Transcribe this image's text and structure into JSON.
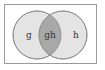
{
  "diagram": {
    "type": "venn",
    "sets": [
      {
        "name": "g",
        "label": "g"
      },
      {
        "name": "h",
        "label": "h"
      }
    ],
    "regions": {
      "left_only": "g",
      "intersection": "gh",
      "right_only": "h"
    },
    "colors": {
      "frame_stroke": "#9a9a9a",
      "background": "#ffffff",
      "circle_fill": "#e4e4e4",
      "circle_stroke": "#8a8a8a",
      "intersection_fill": "#a8a8a8",
      "text": "#333333"
    }
  }
}
